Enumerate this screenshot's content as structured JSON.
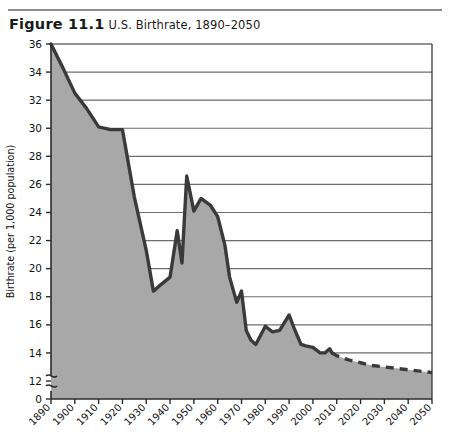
{
  "figure": {
    "number": "Figure 11.1",
    "title": "U.S. Birthrate, 1890–2050"
  },
  "axes": {
    "y_title": "Birthrate (per 1,000 population)",
    "y_ticks": [
      "36",
      "34",
      "32",
      "30",
      "28",
      "26",
      "24",
      "22",
      "20",
      "18",
      "16",
      "14",
      "12",
      "0"
    ],
    "y_break_symbol": "∿",
    "x_ticks": [
      "1890",
      "1900",
      "1910",
      "1920",
      "1930",
      "1940",
      "1950",
      "1960",
      "1970",
      "1980",
      "1990",
      "2000",
      "2010",
      "2020",
      "2030",
      "2040",
      "2050"
    ]
  },
  "colors": {
    "area_fill": "#a8a8a8",
    "line": "#3a3a3a",
    "gridline": "#6e6e6e",
    "axis": "#2b2b2b",
    "background": "#ffffff",
    "rule": "#8a8a8a"
  },
  "chart_data": {
    "type": "area",
    "title": "U.S. Birthrate, 1890–2050",
    "xlabel": "",
    "ylabel": "Birthrate (per 1,000 population)",
    "xlim": [
      1890,
      2050
    ],
    "ylim": [
      12,
      36
    ],
    "y_axis_break": true,
    "y_break_below": 12,
    "grid": "horizontal",
    "legend": "none",
    "series": [
      {
        "name": "Actual birthrate",
        "style": "solid",
        "x": [
          1890,
          1895,
          1900,
          1905,
          1910,
          1915,
          1920,
          1925,
          1930,
          1933,
          1935,
          1940,
          1943,
          1945,
          1947,
          1950,
          1953,
          1957,
          1960,
          1963,
          1965,
          1968,
          1970,
          1972,
          1974,
          1976,
          1980,
          1983,
          1986,
          1990,
          1992,
          1995,
          1997,
          2000,
          2003,
          2005,
          2007,
          2008
        ],
        "values": [
          36.0,
          34.3,
          32.5,
          31.4,
          30.1,
          29.9,
          29.9,
          25.1,
          21.3,
          18.4,
          18.7,
          19.4,
          22.7,
          20.4,
          26.6,
          24.1,
          25.0,
          24.5,
          23.7,
          21.7,
          19.4,
          17.6,
          18.4,
          15.6,
          14.9,
          14.6,
          15.9,
          15.5,
          15.6,
          16.7,
          15.8,
          14.6,
          14.5,
          14.4,
          14.0,
          14.0,
          14.3,
          14.0
        ]
      },
      {
        "name": "Projected birthrate",
        "style": "dashed",
        "x": [
          2008,
          2010,
          2015,
          2020,
          2025,
          2030,
          2035,
          2040,
          2045,
          2050
        ],
        "values": [
          14.0,
          13.8,
          13.5,
          13.3,
          13.1,
          13.0,
          12.9,
          12.8,
          12.7,
          12.6
        ]
      }
    ]
  }
}
